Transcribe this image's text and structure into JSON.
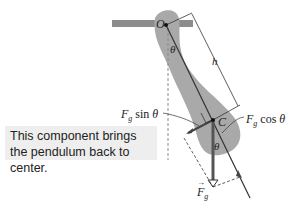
{
  "diagram": {
    "pivot_label": "O",
    "center_label": "C",
    "distance_label": "h",
    "angle_label": "θ",
    "force_label": "F",
    "force_subscript": "g",
    "sin_component": {
      "symbol": "F",
      "subscript": "g",
      "func": "sin",
      "angle": "θ"
    },
    "cos_component": {
      "symbol": "F",
      "subscript": "g",
      "func": "cos",
      "angle": "θ"
    },
    "callout_text": "This component brings the pendulum back to center.",
    "colors": {
      "body": "#a9a9a9",
      "bar": "#8c8c8c",
      "line": "#333333",
      "callout_bg": "#eeeeee"
    }
  }
}
